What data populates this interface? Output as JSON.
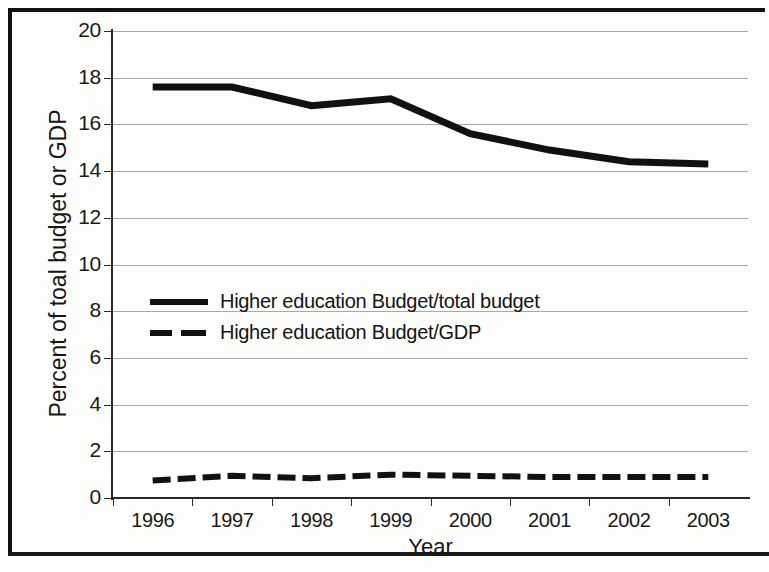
{
  "chart_data": {
    "type": "line",
    "title": "",
    "xlabel": "Year",
    "ylabel": "Percent of toal budget or GDP",
    "categories": [
      "1996",
      "1997",
      "1998",
      "1999",
      "2000",
      "2001",
      "2002",
      "2003"
    ],
    "x": [
      1996,
      1997,
      1998,
      1999,
      2000,
      2001,
      2002,
      2003
    ],
    "series": [
      {
        "name": "Higher education Budget/total budget",
        "style": "solid",
        "color": "#111111",
        "values": [
          17.6,
          17.6,
          16.8,
          17.1,
          15.6,
          14.9,
          14.4,
          14.3
        ]
      },
      {
        "name": "Higher education Budget/GDP",
        "style": "dashed",
        "color": "#111111",
        "values": [
          0.75,
          0.95,
          0.85,
          1.0,
          0.95,
          0.9,
          0.9,
          0.9
        ]
      }
    ],
    "ylim": [
      0,
      20
    ],
    "ytick_values": [
      0,
      2,
      4,
      6,
      8,
      10,
      12,
      14,
      16,
      18,
      20
    ],
    "ytick_labels": [
      "0",
      "2",
      "4",
      "6",
      "8",
      "10",
      "12",
      "14",
      "16",
      "18",
      "20"
    ],
    "grid": true,
    "grid_axis": "y",
    "legend_position": "center-left-inside"
  },
  "axes": {
    "y_label": "Percent of toal budget or GDP",
    "x_label": "Year"
  },
  "legend": {
    "entries": [
      {
        "label": "Higher education Budget/total budget",
        "style": "solid"
      },
      {
        "label": "Higher education Budget/GDP",
        "style": "dashed"
      }
    ]
  }
}
